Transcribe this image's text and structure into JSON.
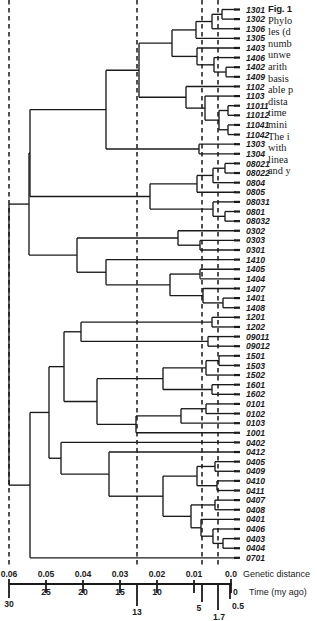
{
  "figure": {
    "caption_title": "Fig. 1",
    "caption_lines": [
      "Phylo",
      "les (d",
      "numb",
      "unwe",
      "arith",
      "basis",
      "able p",
      "dista",
      "time",
      "mini",
      "The i",
      "with",
      "linea",
      "and y"
    ]
  },
  "axes": {
    "genetic_distance": {
      "title": "Genetic distance",
      "ticks": [
        {
          "label": "0.06",
          "value": 0.06,
          "x": 9
        },
        {
          "label": "0.05",
          "value": 0.05,
          "x": 46
        },
        {
          "label": "0.04",
          "value": 0.04,
          "x": 83
        },
        {
          "label": "0.03",
          "value": 0.03,
          "x": 120
        },
        {
          "label": "0.02",
          "value": 0.02,
          "x": 157
        },
        {
          "label": "0.01",
          "value": 0.01,
          "x": 194
        },
        {
          "label": "0.0",
          "value": 0.0,
          "x": 231
        }
      ]
    },
    "time_my_ago": {
      "title": "Time (my ago)",
      "ticks": [
        {
          "label": "30",
          "value": 30,
          "x": 9
        },
        {
          "label": "25",
          "value": 25,
          "x": 46
        },
        {
          "label": "20",
          "value": 20,
          "x": 83
        },
        {
          "label": "15",
          "value": 15,
          "x": 120
        },
        {
          "label": "13",
          "value": 13,
          "x": 137
        },
        {
          "label": "10",
          "value": 10,
          "x": 157
        },
        {
          "label": "5",
          "value": 5,
          "x": 202
        },
        {
          "label": "1.7",
          "value": 1.7,
          "x": 218
        },
        {
          "label": "0.5",
          "value": 0.5,
          "x": 230
        },
        {
          "label": "0",
          "value": 0,
          "x": 232
        }
      ]
    }
  },
  "reference_lines": [
    {
      "name": "line-30my",
      "x": 9
    },
    {
      "name": "line-13my",
      "x": 137
    },
    {
      "name": "line-5my",
      "x": 202
    },
    {
      "name": "line-1.7my",
      "x": 218
    }
  ],
  "chart_data": {
    "type": "dendrogram",
    "xlabel": "Genetic distance",
    "xlabel2": "Time (my ago)",
    "xlim": [
      0.065,
      0.0
    ],
    "grid": false,
    "legend": "none",
    "n_tips": 53,
    "tips": [
      "1301",
      "1302",
      "1306",
      "1305",
      "1403",
      "1406",
      "1402",
      "1409",
      "1102",
      "1103",
      "11011",
      "11012",
      "11041",
      "11042",
      "1303",
      "1304",
      "08021",
      "08022",
      "0804",
      "0805",
      "08031",
      "0801",
      "08032",
      "0302",
      "0303",
      "0301",
      "1410",
      "1405",
      "1404",
      "1407",
      "1401",
      "1408",
      "1201",
      "1202",
      "09011",
      "09012",
      "1501",
      "1503",
      "1502",
      "1601",
      "1602",
      "0101",
      "0102",
      "0103",
      "1001",
      "0402",
      "0412",
      "0405",
      "0409",
      "0410",
      "0411",
      "0407",
      "0408",
      "0401",
      "0406",
      "0403",
      "0404",
      "0701"
    ],
    "tip_list": [
      "1301",
      "1302",
      "1306",
      "1305",
      "1403",
      "1406",
      "1402",
      "1409",
      "1102",
      "1103",
      "11011",
      "11012",
      "11041",
      "11042",
      "1303",
      "1304",
      "08021",
      "08022",
      "0804",
      "0805",
      "08031",
      "0801",
      "08032",
      "0302",
      "0303",
      "0301",
      "1410",
      "1405",
      "1404",
      "1407",
      "1401",
      "1408",
      "1201",
      "1202",
      "09011",
      "09012",
      "1501",
      "1503",
      "1502",
      "1601",
      "1602",
      "0101",
      "0102",
      "0103",
      "1001",
      "0402",
      "0412",
      "0405",
      "0409",
      "0410",
      "0411",
      "0407",
      "0408",
      "0401",
      "0406",
      "0403",
      "0404",
      "0701"
    ],
    "node_depths_genetic_distance": {
      "root": 0.0595,
      "major_clade_A": 0.0345,
      "major_clade_B": 0.0265
    }
  },
  "style": {
    "line_color": "#1a1a1a",
    "dash_color": "#333333",
    "background": "#ffffff"
  }
}
